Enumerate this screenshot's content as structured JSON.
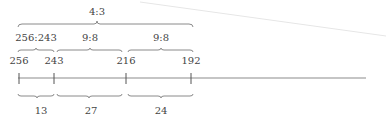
{
  "diagram": {
    "type": "number-line-with-ratio-braces",
    "ratio_top": {
      "label": "4:3",
      "from": "256",
      "to": "192"
    },
    "ratios_middle": [
      {
        "label": "256:243",
        "from": "256",
        "to": "243"
      },
      {
        "label": "9:8",
        "from": "243",
        "to": "216"
      },
      {
        "label": "9:8",
        "from": "216",
        "to": "192"
      }
    ],
    "points": [
      {
        "label": "256"
      },
      {
        "label": "243"
      },
      {
        "label": "216"
      },
      {
        "label": "192"
      }
    ],
    "differences": [
      {
        "label": "13"
      },
      {
        "label": "27"
      },
      {
        "label": "24"
      }
    ]
  }
}
